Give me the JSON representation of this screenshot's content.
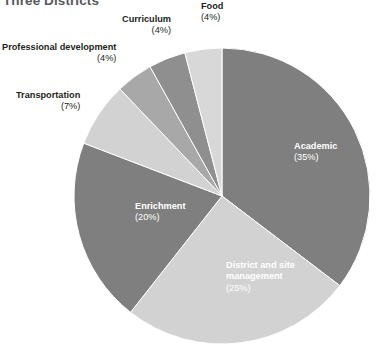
{
  "chart_data": {
    "type": "pie",
    "title": "Three Districts",
    "xlabel": "",
    "ylabel": "",
    "legend": "none",
    "start_angle_deg": 0,
    "direction": "clockwise",
    "categories": [
      "Academic",
      "District and site management",
      "Enrichment",
      "Transportation",
      "Professional development",
      "Curriculum",
      "Food"
    ],
    "values": [
      35,
      25,
      20,
      7,
      4,
      4,
      4
    ],
    "value_unit": "percent",
    "slices": [
      {
        "name": "Academic",
        "value": 35,
        "pct_label": "(35%)",
        "color": "#7f7f7f",
        "label_placement": "inside",
        "label_align": "left"
      },
      {
        "name": "District and site management",
        "value": 25,
        "pct_label": "(25%)",
        "color": "#d2d2d2",
        "label_placement": "inside",
        "label_align": "left",
        "name_line1": "District and site",
        "name_line2": "management"
      },
      {
        "name": "Enrichment",
        "value": 20,
        "pct_label": "(20%)",
        "color": "#7f7f7f",
        "label_placement": "inside",
        "label_align": "left"
      },
      {
        "name": "Transportation",
        "value": 7,
        "pct_label": "(7%)",
        "color": "#d2d2d2",
        "label_placement": "outside",
        "label_align": "right"
      },
      {
        "name": "Professional development",
        "value": 4,
        "pct_label": "(4%)",
        "color": "#a8a8a8",
        "label_placement": "outside",
        "label_align": "right"
      },
      {
        "name": "Curriculum",
        "value": 4,
        "pct_label": "(4%)",
        "color": "#8f8f8f",
        "label_placement": "outside",
        "label_align": "right"
      },
      {
        "name": "Food",
        "value": 4,
        "pct_label": "(4%)",
        "color": "#d8d8d8",
        "label_placement": "outside",
        "label_align": "left"
      }
    ],
    "colors": {
      "academic": "#7f7f7f",
      "district_and_site_management": "#d2d2d2",
      "enrichment": "#7f7f7f",
      "transportation": "#d2d2d2",
      "professional_development": "#a8a8a8",
      "curriculum": "#8f8f8f",
      "food": "#d8d8d8",
      "title_text": "#58595b",
      "outside_label_text": "#231f20",
      "inside_label_text": "#ffffff",
      "background": "#ffffff"
    },
    "geometry": {
      "center_x": 222,
      "center_y": 196,
      "radius": 148
    }
  }
}
